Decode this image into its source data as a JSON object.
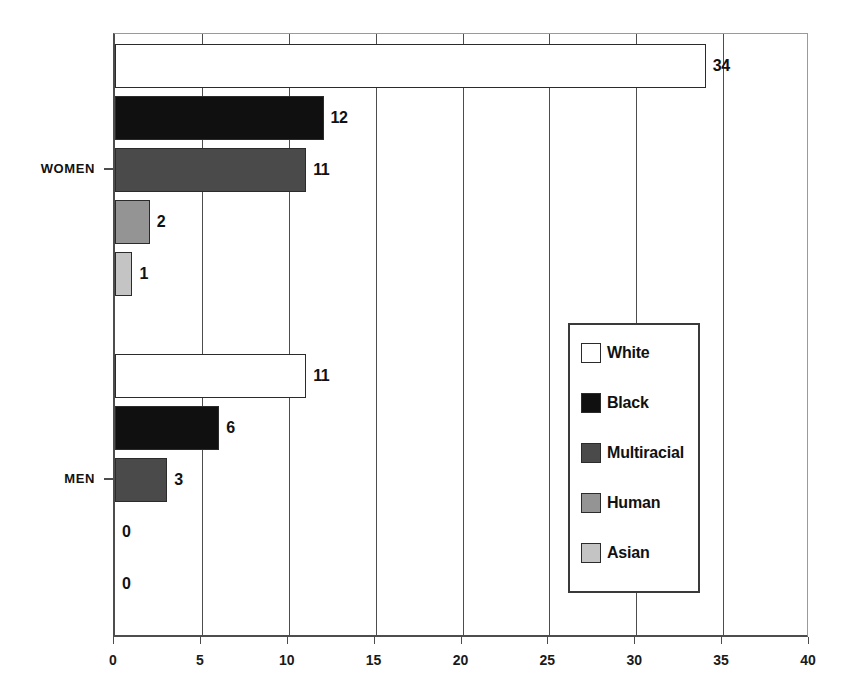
{
  "chart_data": {
    "type": "bar",
    "orientation": "horizontal",
    "title": "",
    "xlabel": "",
    "ylabel": "",
    "xlim": [
      0,
      40
    ],
    "xticks": [
      0,
      5,
      10,
      15,
      20,
      25,
      30,
      35,
      40
    ],
    "xtick_labels": [
      "0",
      "5",
      "10",
      "15",
      "20",
      "25",
      "30",
      "35",
      "40"
    ],
    "grid": true,
    "grid_axis": "x",
    "legend_position": "center-right",
    "categories": [
      "WOMEN",
      "MEN"
    ],
    "series": [
      {
        "name": "White",
        "color": "#ffffff",
        "values": [
          34,
          11
        ]
      },
      {
        "name": "Black",
        "color": "#101010",
        "values": [
          12,
          6
        ]
      },
      {
        "name": "Multiracial",
        "color": "#4a4a4a",
        "values": [
          11,
          3
        ]
      },
      {
        "name": "Human",
        "color": "#949494",
        "values": [
          2,
          0
        ]
      },
      {
        "name": "Asian",
        "color": "#c4c4c4",
        "values": [
          1,
          0
        ]
      }
    ],
    "groups": [
      {
        "label": "WOMEN",
        "bars": [
          {
            "series": "White",
            "value": 34,
            "value_label": "34",
            "color": "#ffffff"
          },
          {
            "series": "Black",
            "value": 12,
            "value_label": "12",
            "color": "#101010"
          },
          {
            "series": "Multiracial",
            "value": 11,
            "value_label": "11",
            "color": "#4a4a4a"
          },
          {
            "series": "Human",
            "value": 2,
            "value_label": "2",
            "color": "#949494"
          },
          {
            "series": "Asian",
            "value": 1,
            "value_label": "1",
            "color": "#c4c4c4"
          }
        ]
      },
      {
        "label": "MEN",
        "bars": [
          {
            "series": "White",
            "value": 11,
            "value_label": "11",
            "color": "#ffffff"
          },
          {
            "series": "Black",
            "value": 6,
            "value_label": "6",
            "color": "#101010"
          },
          {
            "series": "Multiracial",
            "value": 3,
            "value_label": "3",
            "color": "#4a4a4a"
          },
          {
            "series": "Human",
            "value": 0,
            "value_label": "0",
            "color": "#949494"
          },
          {
            "series": "Asian",
            "value": 0,
            "value_label": "0",
            "color": "#c4c4c4"
          }
        ]
      }
    ],
    "legend": [
      {
        "label": "White",
        "color": "#ffffff"
      },
      {
        "label": "Black",
        "color": "#101010"
      },
      {
        "label": "Multiracial",
        "color": "#4a4a4a"
      },
      {
        "label": "Human",
        "color": "#949494"
      },
      {
        "label": "Asian",
        "color": "#c4c4c4"
      }
    ]
  }
}
